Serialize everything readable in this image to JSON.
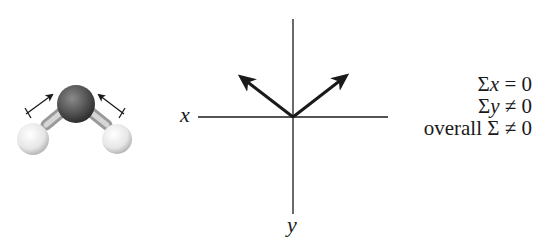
{
  "molecule": {
    "name": "water",
    "atoms": [
      "O",
      "H",
      "H"
    ],
    "dipole_arrows": 2
  },
  "axes": {
    "x_label": "x",
    "y_label": "y"
  },
  "vectors": [
    {
      "direction": "up-left"
    },
    {
      "direction": "up-right"
    }
  ],
  "equations": {
    "line1_sigma": "Σ",
    "line1_var": "x",
    "line1_rest": " = 0",
    "line2_sigma": "Σ",
    "line2_var": "y",
    "line2_rest": " ≠ 0",
    "line3_prefix": "overall ",
    "line3_rest": "Σ ≠ 0"
  },
  "colors": {
    "line": "#1a1a1a",
    "oxygen": "#5a5a5a",
    "hydrogen": "#e8e8e8"
  }
}
